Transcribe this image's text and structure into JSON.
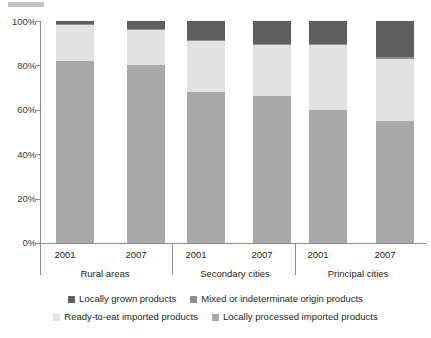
{
  "chart_data": {
    "type": "bar",
    "stacked": true,
    "stack_mode": "percent",
    "title": "",
    "subtitle": "",
    "xlabel": "",
    "ylabel": "",
    "ylim": [
      0,
      100
    ],
    "yticks": [
      0,
      20,
      40,
      60,
      80,
      100
    ],
    "ytick_labels": [
      "0%",
      "20%",
      "40%",
      "60%",
      "80%",
      "100%"
    ],
    "grid": false,
    "legend_position": "bottom",
    "categories": [
      "2001",
      "2007",
      "2001",
      "2007",
      "2001",
      "2007"
    ],
    "groups": [
      {
        "label": "Rural areas",
        "categories": [
          "2001",
          "2007"
        ]
      },
      {
        "label": "Secondary cities",
        "categories": [
          "2001",
          "2007"
        ]
      },
      {
        "label": "Principal cities",
        "categories": [
          "2001",
          "2007"
        ]
      }
    ],
    "series": [
      {
        "name": "Locally processed imported products",
        "color": "#a8a8a8",
        "values": [
          82,
          80,
          68,
          66,
          60,
          55
        ]
      },
      {
        "name": "Ready-to-eat imported products",
        "color": "#e2e2e2",
        "values": [
          16,
          16,
          23,
          23,
          29,
          28
        ]
      },
      {
        "name": "Mixed or indeterminate origin products",
        "color": "#8f8f8f",
        "values": [
          0.5,
          0.5,
          0.5,
          0.5,
          0.5,
          1
        ]
      },
      {
        "name": "Locally grown products",
        "color": "#5e5e5e",
        "values": [
          1.5,
          3.5,
          8.5,
          10.5,
          10.5,
          16
        ]
      }
    ]
  },
  "axis": {
    "y_tick_labels": [
      "100%",
      "80%",
      "60%",
      "40%",
      "20%",
      "0%"
    ],
    "x_year_labels": [
      "2001",
      "2007",
      "2001",
      "2007",
      "2001",
      "2007"
    ],
    "x_group_labels": [
      "Rural areas",
      "Secondary cities",
      "Principal cities"
    ]
  },
  "legend": {
    "row1": [
      {
        "label": "Locally grown products",
        "color": "#5e5e5e"
      },
      {
        "label": "Mixed or indeterminate origin products",
        "color": "#8f8f8f"
      }
    ],
    "row2": [
      {
        "label": "Ready-to-eat imported products",
        "color": "#e2e2e2"
      },
      {
        "label": "Locally processed imported products",
        "color": "#a8a8a8"
      }
    ]
  }
}
